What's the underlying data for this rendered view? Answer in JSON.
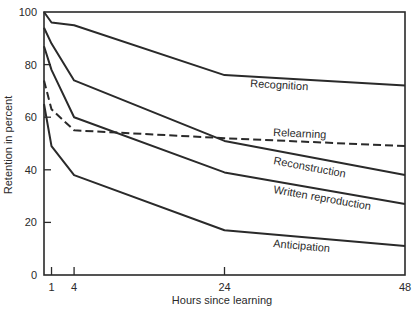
{
  "chart_data": {
    "type": "line",
    "title": "",
    "xlabel": "Hours since learning",
    "ylabel": "Retention in percent",
    "xlim": [
      0,
      48
    ],
    "ylim": [
      0,
      100
    ],
    "x_ticks": [
      1,
      4,
      24,
      48
    ],
    "y_ticks": [
      0,
      20,
      40,
      60,
      80,
      100
    ],
    "grid": false,
    "legend": "inline labels",
    "x": [
      0,
      1,
      4,
      24,
      48
    ],
    "series": [
      {
        "name": "Recognition",
        "values": [
          100,
          96,
          95,
          76,
          72
        ],
        "style": "solid",
        "label_pos": [
          250,
          87
        ]
      },
      {
        "name": "Relearning",
        "values": [
          74,
          63,
          55,
          52,
          49
        ],
        "style": "dashed",
        "label_pos": [
          273,
          136
        ]
      },
      {
        "name": "Reconstruction",
        "values": [
          94,
          88,
          74,
          51,
          38
        ],
        "style": "solid",
        "label_pos": [
          273,
          164
        ]
      },
      {
        "name": "Written reproduction",
        "values": [
          87,
          78,
          60,
          39,
          27
        ],
        "style": "solid",
        "label_pos": [
          273,
          193
        ]
      },
      {
        "name": "Anticipation",
        "values": [
          65,
          49,
          38,
          17,
          11
        ],
        "style": "solid",
        "label_pos": [
          273,
          247
        ]
      }
    ]
  },
  "colors": {
    "line": "#2a2a2a",
    "background": "#ffffff"
  }
}
